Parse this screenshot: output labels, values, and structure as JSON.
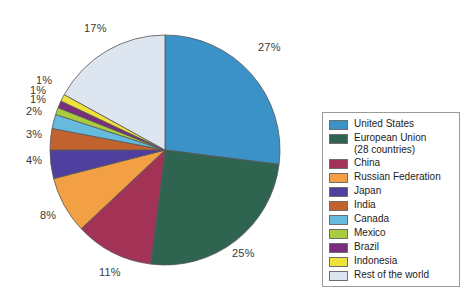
{
  "chart_data": {
    "type": "pie",
    "title": "",
    "subtitle": "",
    "xlabel": "",
    "ylabel": "",
    "legend_position": "right",
    "grid": false,
    "units": "percent",
    "start_angle_deg": 0,
    "direction": "clockwise",
    "categories": [
      "United States",
      "European Union (28 countries)",
      "China",
      "Russian Federation",
      "Japan",
      "India",
      "Canada",
      "Mexico",
      "Brazil",
      "Indonesia",
      "Rest of the world"
    ],
    "values": [
      27,
      25,
      11,
      8,
      4,
      3,
      2,
      1,
      1,
      1,
      17
    ],
    "data_labels": [
      "27%",
      "25%",
      "11%",
      "8%",
      "4%",
      "3%",
      "2%",
      "1%",
      "1%",
      "1%",
      "17%"
    ],
    "colors": [
      "#3a92c7",
      "#2f6450",
      "#a33356",
      "#f2a043",
      "#4f3f9e",
      "#c2622e",
      "#65bade",
      "#a9cc3e",
      "#7a2d7c",
      "#f0e23d",
      "#dde5f1"
    ],
    "slices": [
      {
        "label": "United States",
        "value": 27,
        "data_label": "27%",
        "color": "#3a92c7"
      },
      {
        "label": "European Union (28 countries)",
        "value": 25,
        "data_label": "25%",
        "color": "#2f6450"
      },
      {
        "label": "China",
        "value": 11,
        "data_label": "11%",
        "color": "#a33356"
      },
      {
        "label": "Russian Federation",
        "value": 8,
        "data_label": "8%",
        "color": "#f2a043"
      },
      {
        "label": "Japan",
        "value": 4,
        "data_label": "4%",
        "color": "#4f3f9e"
      },
      {
        "label": "India",
        "value": 3,
        "data_label": "3%",
        "color": "#c2622e"
      },
      {
        "label": "Canada",
        "value": 2,
        "data_label": "2%",
        "color": "#65bade"
      },
      {
        "label": "Mexico",
        "value": 1,
        "data_label": "1%",
        "color": "#a9cc3e"
      },
      {
        "label": "Brazil",
        "value": 1,
        "data_label": "1%",
        "color": "#7a2d7c"
      },
      {
        "label": "Indonesia",
        "value": 1,
        "data_label": "1%",
        "color": "#f0e23d"
      },
      {
        "label": "Rest of the world",
        "value": 17,
        "data_label": "17%",
        "color": "#dde5f1"
      }
    ]
  },
  "pie": {
    "center_x": 165,
    "center_y": 150,
    "radius": 115,
    "outline_color": "#555555",
    "labels": [
      {
        "text": "27%",
        "x": 258,
        "y": 41
      },
      {
        "text": "25%",
        "x": 232,
        "y": 247
      },
      {
        "text": "11%",
        "x": 99,
        "y": 266
      },
      {
        "text": "8%",
        "x": 40,
        "y": 209
      },
      {
        "text": "4%",
        "x": 26,
        "y": 154
      },
      {
        "text": "3%",
        "x": 26,
        "y": 128
      },
      {
        "text": "2%",
        "x": 26,
        "y": 105
      },
      {
        "text": "1%",
        "x": 30,
        "y": 93
      },
      {
        "text": "1%",
        "x": 30,
        "y": 84
      },
      {
        "text": "1%",
        "x": 36,
        "y": 74
      },
      {
        "text": "17%",
        "x": 84,
        "y": 22
      }
    ]
  },
  "legend": {
    "items": [
      {
        "label": "United States",
        "sub": "",
        "color": "#3a92c7"
      },
      {
        "label": "European Union",
        "sub": "(28 countries)",
        "color": "#2f6450"
      },
      {
        "label": "China",
        "sub": "",
        "color": "#a33356"
      },
      {
        "label": "Russian Federation",
        "sub": "",
        "color": "#f2a043"
      },
      {
        "label": "Japan",
        "sub": "",
        "color": "#4f3f9e"
      },
      {
        "label": "India",
        "sub": "",
        "color": "#c2622e"
      },
      {
        "label": "Canada",
        "sub": "",
        "color": "#65bade"
      },
      {
        "label": "Mexico",
        "sub": "",
        "color": "#a9cc3e"
      },
      {
        "label": "Brazil",
        "sub": "",
        "color": "#7a2d7c"
      },
      {
        "label": "Indonesia",
        "sub": "",
        "color": "#f0e23d"
      },
      {
        "label": "Rest of the world",
        "sub": "",
        "color": "#dde5f1"
      }
    ]
  }
}
